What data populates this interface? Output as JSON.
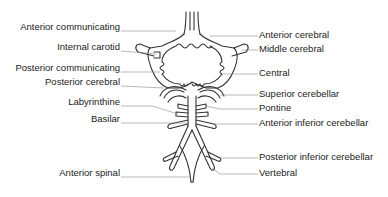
{
  "diagram": {
    "line_color": "#333333",
    "label_color": "#222222",
    "left_labels": [
      {
        "id": "anterior-communicating",
        "text": "Anterior communicating",
        "x_right": 120,
        "y": 26
      },
      {
        "id": "internal-carotid",
        "text": "Internal carotid",
        "x_right": 120,
        "y": 46
      },
      {
        "id": "posterior-communicating",
        "text": "Posterior communicating",
        "x_right": 120,
        "y": 67
      },
      {
        "id": "posterior-cerebral",
        "text": "Posterior cerebral",
        "x_right": 120,
        "y": 81
      },
      {
        "id": "labyrinthine",
        "text": "Labyrinthine",
        "x_right": 120,
        "y": 101
      },
      {
        "id": "basilar",
        "text": "Basilar",
        "x_right": 120,
        "y": 118
      },
      {
        "id": "anterior-spinal",
        "text": "Anterior spinal",
        "x_right": 120,
        "y": 172
      }
    ],
    "right_labels": [
      {
        "id": "anterior-cerebral",
        "text": "Anterior cerebral",
        "x": 259,
        "y": 34
      },
      {
        "id": "middle-cerebral",
        "text": "Middle cerebral",
        "x": 259,
        "y": 48
      },
      {
        "id": "central",
        "text": "Central",
        "x": 259,
        "y": 71
      },
      {
        "id": "superior-cerebellar",
        "text": "Superior cerebellar",
        "x": 259,
        "y": 92
      },
      {
        "id": "pontine",
        "text": "Pontine",
        "x": 259,
        "y": 105
      },
      {
        "id": "anterior-inferior-cerebellar",
        "text": "Anterior inferior cerebellar",
        "x": 259,
        "y": 121
      },
      {
        "id": "posterior-inferior-cerebellar",
        "text": "Posterior inferior cerebellar",
        "x": 259,
        "y": 154
      },
      {
        "id": "vertebral",
        "text": "Vertebral",
        "x": 259,
        "y": 170
      }
    ]
  }
}
